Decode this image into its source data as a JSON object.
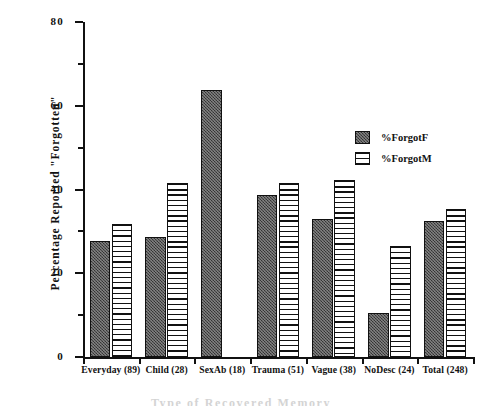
{
  "chart_data": {
    "type": "bar",
    "title": "",
    "xlabel": "Type of Recovered Memory",
    "ylabel": "Percentage Reported \"Forgotten\"",
    "ylim": [
      0,
      80
    ],
    "yticks": [
      0,
      20,
      40,
      60,
      80
    ],
    "yticks_minor": [
      10,
      30,
      50,
      70
    ],
    "grid": false,
    "legend_position": "upper-right-inside",
    "categories": [
      "Everyday (89)",
      "Child (28)",
      "SexAb (18)",
      "Trauma (51)",
      "Vague (38)",
      "NoDesc (24)",
      "Total (248)"
    ],
    "series": [
      {
        "name": "%ForgotF",
        "pattern": "dark-stipple",
        "color": "#4a4a4a",
        "values": [
          27.7,
          28.6,
          63.8,
          38.7,
          33.0,
          10.4,
          32.5
        ]
      },
      {
        "name": "%ForgotM",
        "pattern": "horizontal-lines",
        "color": "#ffffff",
        "values": [
          31.7,
          41.5,
          0,
          41.5,
          42.3,
          26.6,
          35.4
        ]
      }
    ]
  },
  "legend": {
    "items": [
      {
        "label": "%ForgotF"
      },
      {
        "label": "%ForgotM"
      }
    ]
  },
  "axes": {
    "y_title": "Percentage Reported \"Forgotten\"",
    "x_title": "Type of Recovered Memory",
    "y_tick_labels": [
      "0",
      "20",
      "40",
      "60",
      "80"
    ]
  }
}
